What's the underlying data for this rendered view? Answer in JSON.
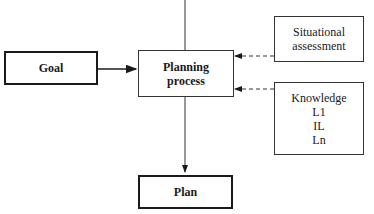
{
  "diagram": {
    "nodes": {
      "goal": {
        "label": "Goal"
      },
      "planning": {
        "line1": "Planning",
        "line2": "process"
      },
      "situational": {
        "line1": "Situational",
        "line2": "assessment"
      },
      "knowledge": {
        "line1": "Knowledge",
        "line2": "L1",
        "line3": "IL",
        "line4": "Ln"
      },
      "plan": {
        "label": "Plan"
      }
    },
    "edges": [
      {
        "from": "top",
        "to": "planning",
        "style": "solid"
      },
      {
        "from": "goal",
        "to": "planning",
        "style": "solid-arrow"
      },
      {
        "from": "situational",
        "to": "planning",
        "style": "dashed-arrow"
      },
      {
        "from": "knowledge",
        "to": "planning",
        "style": "dashed-arrow"
      },
      {
        "from": "planning",
        "to": "plan",
        "style": "solid-arrow"
      }
    ]
  }
}
